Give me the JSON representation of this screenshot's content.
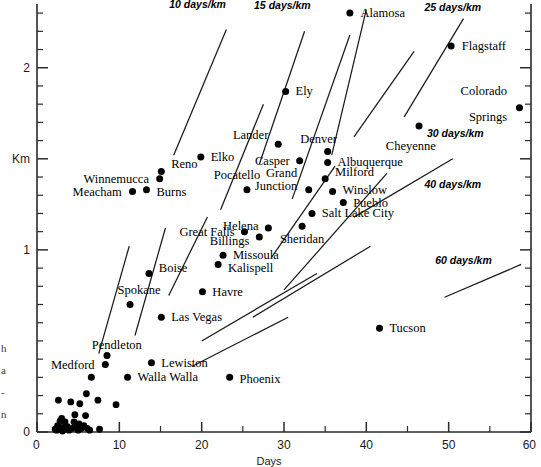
{
  "chart_data": {
    "type": "scatter",
    "title": "",
    "xlabel": "Days",
    "ylabel": "Km",
    "xlim": [
      0,
      60
    ],
    "ylim": [
      0,
      2.35
    ],
    "grid": false,
    "legend": "none",
    "xticks": [
      0,
      10,
      20,
      30,
      40,
      50,
      60
    ],
    "xtick_labels": [
      "0",
      "10",
      "20",
      "30",
      "40",
      "50",
      "60"
    ],
    "xminor_step": 5,
    "yticks": [
      0,
      1,
      2
    ],
    "ytick_labels": [
      "0",
      "1",
      "2"
    ],
    "yminor_step": 0.1,
    "y_axis_caption": "Km",
    "y_axis_caption_value": 1.5,
    "points": [
      {
        "label": "Alamosa",
        "x": 38.0,
        "y": 2.3,
        "lx": 39.3,
        "ly": 2.3,
        "anchor": "start"
      },
      {
        "label": "Flagstaff",
        "x": 50.3,
        "y": 2.12,
        "lx": 51.6,
        "ly": 2.12,
        "anchor": "start"
      },
      {
        "label": "Ely",
        "x": 30.2,
        "y": 1.87,
        "lx": 31.4,
        "ly": 1.87,
        "anchor": "start"
      },
      {
        "label": "Colorado",
        "x": 58.6,
        "y": 1.78,
        "lx": 57.1,
        "ly": 1.87,
        "anchor": "end"
      },
      {
        "label": "Springs",
        "x": null,
        "y": null,
        "lx": 57.1,
        "ly": 1.73,
        "anchor": "end"
      },
      {
        "label": "Cheyenne",
        "x": 46.4,
        "y": 1.68,
        "lx": 45.4,
        "ly": 1.57,
        "anchor": "middle"
      },
      {
        "label": "Lander",
        "x": 29.3,
        "y": 1.58,
        "lx": 28.1,
        "ly": 1.63,
        "anchor": "end"
      },
      {
        "label": "Denver",
        "x": 35.3,
        "y": 1.54,
        "lx": 34.2,
        "ly": 1.61,
        "anchor": "middle"
      },
      {
        "label": "Albuquerque",
        "x": 35.3,
        "y": 1.48,
        "lx": 36.5,
        "ly": 1.48,
        "anchor": "start"
      },
      {
        "label": "Casper",
        "x": 31.9,
        "y": 1.49,
        "lx": 30.7,
        "ly": 1.49,
        "anchor": "end"
      },
      {
        "label": "Elko",
        "x": 19.9,
        "y": 1.51,
        "lx": 21.1,
        "ly": 1.51,
        "anchor": "start"
      },
      {
        "label": "Milford",
        "x": 35.0,
        "y": 1.39,
        "lx": 36.2,
        "ly": 1.43,
        "anchor": "start"
      },
      {
        "label": "Grand",
        "x": 33.0,
        "y": 1.33,
        "lx": 31.6,
        "ly": 1.42,
        "anchor": "end"
      },
      {
        "label": "Junction",
        "x": null,
        "y": null,
        "lx": 31.6,
        "ly": 1.35,
        "anchor": "end"
      },
      {
        "label": "Winslow",
        "x": 35.9,
        "y": 1.32,
        "lx": 37.1,
        "ly": 1.33,
        "anchor": "start"
      },
      {
        "label": "Pueblo",
        "x": 37.2,
        "y": 1.26,
        "lx": 38.4,
        "ly": 1.26,
        "anchor": "start"
      },
      {
        "label": "Pocatello",
        "x": 25.5,
        "y": 1.33,
        "lx": 24.3,
        "ly": 1.41,
        "anchor": "middle"
      },
      {
        "label": "Reno",
        "x": 15.1,
        "y": 1.43,
        "lx": 16.3,
        "ly": 1.47,
        "anchor": "start"
      },
      {
        "label": "Winnemucca",
        "x": 14.9,
        "y": 1.39,
        "lx": 13.6,
        "ly": 1.39,
        "anchor": "end"
      },
      {
        "label": "Burns",
        "x": 13.3,
        "y": 1.33,
        "lx": 14.5,
        "ly": 1.32,
        "anchor": "start"
      },
      {
        "label": "Meacham",
        "x": 11.6,
        "y": 1.32,
        "lx": 10.3,
        "ly": 1.32,
        "anchor": "end"
      },
      {
        "label": "Salt Lake City",
        "x": 33.4,
        "y": 1.2,
        "lx": 34.6,
        "ly": 1.2,
        "anchor": "start"
      },
      {
        "label": "Sheridan",
        "x": 32.2,
        "y": 1.13,
        "lx": 32.2,
        "ly": 1.06,
        "anchor": "middle"
      },
      {
        "label": "Helena",
        "x": 28.1,
        "y": 1.12,
        "lx": 26.9,
        "ly": 1.13,
        "anchor": "end"
      },
      {
        "label": "Great Falls",
        "x": 25.2,
        "y": 1.1,
        "lx": 24.0,
        "ly": 1.1,
        "anchor": "end"
      },
      {
        "label": "Billings",
        "x": 27.0,
        "y": 1.07,
        "lx": 25.8,
        "ly": 1.05,
        "anchor": "end"
      },
      {
        "label": "Missoula",
        "x": 22.6,
        "y": 0.97,
        "lx": 23.8,
        "ly": 0.97,
        "anchor": "start"
      },
      {
        "label": "Kalispell",
        "x": 22.0,
        "y": 0.92,
        "lx": 23.2,
        "ly": 0.9,
        "anchor": "start"
      },
      {
        "label": "Boise",
        "x": 13.6,
        "y": 0.87,
        "lx": 14.8,
        "ly": 0.9,
        "anchor": "start"
      },
      {
        "label": "Havre",
        "x": 20.1,
        "y": 0.77,
        "lx": 21.3,
        "ly": 0.77,
        "anchor": "start"
      },
      {
        "label": "Spokane",
        "x": 11.3,
        "y": 0.7,
        "lx": 12.4,
        "ly": 0.78,
        "anchor": "middle"
      },
      {
        "label": "Las Vegas",
        "x": 15.1,
        "y": 0.63,
        "lx": 16.3,
        "ly": 0.63,
        "anchor": "start"
      },
      {
        "label": "Tucson",
        "x": 41.6,
        "y": 0.57,
        "lx": 42.8,
        "ly": 0.57,
        "anchor": "start"
      },
      {
        "label": "Pendleton",
        "x": 8.5,
        "y": 0.42,
        "lx": 9.7,
        "ly": 0.48,
        "anchor": "middle"
      },
      {
        "label": "Lewiston",
        "x": 13.9,
        "y": 0.38,
        "lx": 15.1,
        "ly": 0.38,
        "anchor": "start"
      },
      {
        "label": "Medford",
        "x": 8.3,
        "y": 0.37,
        "lx": 7.0,
        "ly": 0.37,
        "anchor": "end"
      },
      {
        "label": "Walla Walla",
        "x": 11.0,
        "y": 0.3,
        "lx": 12.2,
        "ly": 0.3,
        "anchor": "start"
      },
      {
        "label": "Phoenix",
        "x": 23.4,
        "y": 0.3,
        "lx": 24.6,
        "ly": 0.29,
        "anchor": "start"
      },
      {
        "label": "",
        "x": 6.6,
        "y": 0.3,
        "lx": null,
        "ly": null,
        "anchor": "start"
      }
    ],
    "cluster_points": [
      {
        "x": 2.6,
        "y": 0.175
      },
      {
        "x": 4.1,
        "y": 0.165
      },
      {
        "x": 6.0,
        "y": 0.21
      },
      {
        "x": 5.2,
        "y": 0.155
      },
      {
        "x": 7.4,
        "y": 0.175
      },
      {
        "x": 9.6,
        "y": 0.15
      },
      {
        "x": 4.6,
        "y": 0.095
      },
      {
        "x": 5.9,
        "y": 0.09
      },
      {
        "x": 3.0,
        "y": 0.075
      },
      {
        "x": 3.4,
        "y": 0.055
      },
      {
        "x": 2.5,
        "y": 0.035
      },
      {
        "x": 2.9,
        "y": 0.025
      },
      {
        "x": 3.3,
        "y": 0.02
      },
      {
        "x": 3.7,
        "y": 0.03
      },
      {
        "x": 2.2,
        "y": 0.015
      },
      {
        "x": 4.3,
        "y": 0.02
      },
      {
        "x": 4.8,
        "y": 0.03
      },
      {
        "x": 5.1,
        "y": 0.045
      },
      {
        "x": 5.4,
        "y": 0.02
      },
      {
        "x": 5.7,
        "y": 0.035
      },
      {
        "x": 6.1,
        "y": 0.02
      },
      {
        "x": 2.8,
        "y": 0.06
      },
      {
        "x": 3.9,
        "y": 0.01
      },
      {
        "x": 4.5,
        "y": 0.055
      },
      {
        "x": 5.0,
        "y": 0.01
      },
      {
        "x": 2.4,
        "y": 0.01
      },
      {
        "x": 6.4,
        "y": 0.01
      },
      {
        "x": 7.6,
        "y": 0.015
      },
      {
        "x": 3.1,
        "y": 0.005
      }
    ],
    "iso_lines": [
      {
        "label": "10 days/km",
        "x1": 16.6,
        "y1": 1.52,
        "x2": 23.0,
        "y2": 2.21,
        "lx": 19.5,
        "ly": 2.33,
        "rot": 0
      },
      {
        "label": "15 days/km",
        "x1": 27.0,
        "y1": 1.47,
        "x2": 32.5,
        "y2": 2.2,
        "lx": 29.8,
        "ly": 2.32,
        "rot": 0
      },
      {
        "label": "25 days/km",
        "x1": 44.6,
        "y1": 1.73,
        "x2": 51.8,
        "y2": 2.27,
        "lx": 50.5,
        "ly": 2.31,
        "rot": 0
      },
      {
        "label": "30 days/km",
        "x1": 38.5,
        "y1": 1.62,
        "x2": 45.8,
        "y2": 2.09,
        "lx": 50.8,
        "ly": 1.62,
        "rot": 0
      },
      {
        "label": "40 days/km",
        "x1": 38.5,
        "y1": 1.18,
        "x2": 50.5,
        "y2": 1.5,
        "lx": 50.5,
        "ly": 1.34,
        "rot": 0
      },
      {
        "label": "60 days/km",
        "x1": 49.5,
        "y1": 0.74,
        "x2": 58.8,
        "y2": 0.92,
        "lx": 51.8,
        "ly": 0.92,
        "rot": 0
      },
      {
        "label": "",
        "x1": 35.8,
        "y1": 1.52,
        "x2": 40.0,
        "y2": 2.32,
        "lx": null,
        "ly": null,
        "rot": 0
      },
      {
        "label": "",
        "x1": 31.0,
        "y1": 1.28,
        "x2": 38.0,
        "y2": 2.18,
        "lx": null,
        "ly": null,
        "rot": 0
      },
      {
        "label": "",
        "x1": 22.3,
        "y1": 1.22,
        "x2": 27.5,
        "y2": 1.8,
        "lx": null,
        "ly": null,
        "rot": 0
      },
      {
        "label": "",
        "x1": 28.5,
        "y1": 0.96,
        "x2": 36.2,
        "y2": 1.46,
        "lx": null,
        "ly": null,
        "rot": 0
      },
      {
        "label": "",
        "x1": 30.0,
        "y1": 0.78,
        "x2": 42.5,
        "y2": 1.42,
        "lx": null,
        "ly": null,
        "rot": 0
      },
      {
        "label": "",
        "x1": 26.2,
        "y1": 0.63,
        "x2": 40.5,
        "y2": 1.02,
        "lx": null,
        "ly": null,
        "rot": 0
      },
      {
        "label": "",
        "x1": 20.0,
        "y1": 0.5,
        "x2": 34.0,
        "y2": 0.87,
        "lx": null,
        "ly": null,
        "rot": 0
      },
      {
        "label": "",
        "x1": 16.0,
        "y1": 0.75,
        "x2": 20.7,
        "y2": 1.18,
        "lx": null,
        "ly": null,
        "rot": 0
      },
      {
        "label": "",
        "x1": 11.9,
        "y1": 0.53,
        "x2": 15.6,
        "y2": 1.12,
        "lx": null,
        "ly": null,
        "rot": 0
      },
      {
        "label": "",
        "x1": 7.5,
        "y1": 0.43,
        "x2": 11.2,
        "y2": 1.02,
        "lx": null,
        "ly": null,
        "rot": 0
      },
      {
        "label": "",
        "x1": 18.8,
        "y1": 0.36,
        "x2": 30.5,
        "y2": 0.63,
        "lx": null,
        "ly": null,
        "rot": 0
      }
    ]
  },
  "edge_fragments": [
    "h",
    "a",
    "-",
    "n"
  ],
  "colors": {
    "background": "#ffffff",
    "axis": "#2b2b2b",
    "point": "#000000",
    "line": "#1a1a1a",
    "text": "#000000"
  }
}
